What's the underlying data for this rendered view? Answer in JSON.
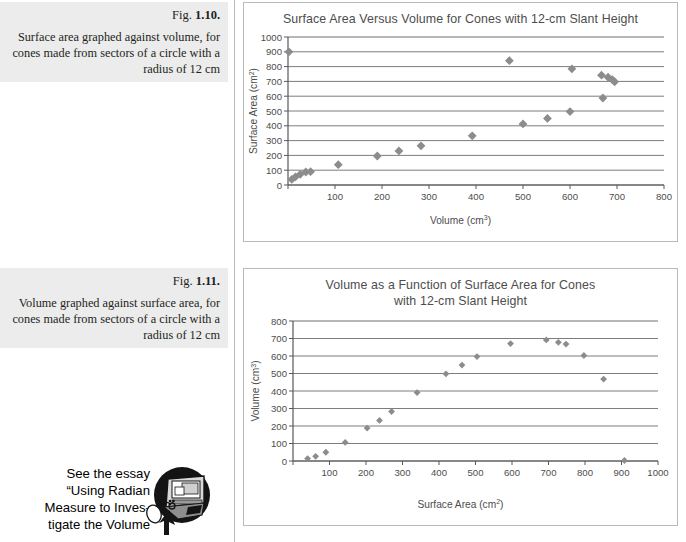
{
  "figures": [
    {
      "fig_label_prefix": "Fig. ",
      "fig_number": "1.10.",
      "caption": "Surface area graphed against volume, for cones made from sectors of a circle with a radius of 12 cm"
    },
    {
      "fig_label_prefix": "Fig. ",
      "fig_number": "1.11.",
      "caption": "Volume graphed against surface area, for cones made from sectors of a circle with a radius of 12 cm"
    }
  ],
  "essay": {
    "icon_name": "computer-mouse-icon",
    "lines": [
      "See the essay",
      "“Using Radian",
      "Measure to Inves-",
      "tigate the Volume"
    ]
  },
  "colors": {
    "marker": "#8c8c8c",
    "axis": "#58585a",
    "grid": "#6d6e71",
    "text": "#4d4d4d",
    "caption_band": "#ececec",
    "box_border": "#b9b9b9"
  },
  "chart_data": [
    {
      "type": "scatter",
      "title": "Surface Area Versus Volume for Cones with 12-cm Slant Height",
      "xlabel": "Volume (cm3)",
      "xlabel_base": "Volume (cm",
      "xlabel_sup": "3",
      "xlabel_tail": ")",
      "ylabel": "Surface Area (cm2)",
      "ylabel_base": "Surface Area (cm",
      "ylabel_sup": "2",
      "ylabel_tail": ")",
      "xlim": [
        0,
        800
      ],
      "ylim": [
        0,
        1000
      ],
      "xticks": [
        0,
        100,
        200,
        300,
        400,
        500,
        600,
        700,
        800
      ],
      "xticklabels": [
        "",
        "100",
        "200",
        "300",
        "400",
        "500",
        "600",
        "700",
        "800"
      ],
      "yticks": [
        0,
        100,
        200,
        300,
        400,
        500,
        600,
        700,
        800,
        900,
        1000
      ],
      "yticklabels": [
        "0",
        "100",
        "200",
        "300",
        "400",
        "500",
        "600",
        "700",
        "800",
        "900",
        "1000"
      ],
      "grid": "horizontal",
      "legend": "none",
      "points": [
        {
          "x": 2,
          "y": 900
        },
        {
          "x": 8,
          "y": 38
        },
        {
          "x": 16,
          "y": 55
        },
        {
          "x": 26,
          "y": 72
        },
        {
          "x": 38,
          "y": 88
        },
        {
          "x": 48,
          "y": 90
        },
        {
          "x": 107,
          "y": 137
        },
        {
          "x": 190,
          "y": 196
        },
        {
          "x": 236,
          "y": 230
        },
        {
          "x": 283,
          "y": 265
        },
        {
          "x": 392,
          "y": 332
        },
        {
          "x": 471,
          "y": 840
        },
        {
          "x": 500,
          "y": 413
        },
        {
          "x": 552,
          "y": 450
        },
        {
          "x": 600,
          "y": 496
        },
        {
          "x": 604,
          "y": 785
        },
        {
          "x": 667,
          "y": 742
        },
        {
          "x": 670,
          "y": 588
        },
        {
          "x": 681,
          "y": 728
        },
        {
          "x": 690,
          "y": 712
        },
        {
          "x": 695,
          "y": 697
        }
      ]
    },
    {
      "type": "scatter",
      "title_line1": "Volume as a Function of Surface Area for Cones",
      "title_line2": "with 12-cm Slant Height",
      "title": "Volume as a Function of Surface Area for Cones with 12-cm Slant Height",
      "xlabel": "Surface Area (cm2)",
      "xlabel_base": "Surface Area (cm",
      "xlabel_sup": "2",
      "xlabel_tail": ")",
      "ylabel": "Volume (cm3)",
      "ylabel_base": "Volume (cm",
      "ylabel_sup": "3",
      "ylabel_tail": ")",
      "xlim": [
        0,
        1000
      ],
      "ylim": [
        0,
        800
      ],
      "xticks": [
        0,
        100,
        200,
        300,
        400,
        500,
        600,
        700,
        800,
        900,
        1000
      ],
      "xticklabels": [
        "",
        "100",
        "200",
        "300",
        "400",
        "500",
        "600",
        "700",
        "800",
        "900",
        "1000"
      ],
      "yticks": [
        0,
        100,
        200,
        300,
        400,
        500,
        600,
        700,
        800
      ],
      "yticklabels": [
        "0",
        "100",
        "200",
        "300",
        "400",
        "500",
        "600",
        "700",
        "800"
      ],
      "grid": "horizontal",
      "legend": "none",
      "points": [
        {
          "x": 40,
          "y": 14
        },
        {
          "x": 62,
          "y": 27
        },
        {
          "x": 90,
          "y": 50
        },
        {
          "x": 143,
          "y": 106
        },
        {
          "x": 203,
          "y": 188
        },
        {
          "x": 237,
          "y": 232
        },
        {
          "x": 270,
          "y": 283
        },
        {
          "x": 340,
          "y": 391
        },
        {
          "x": 419,
          "y": 498
        },
        {
          "x": 463,
          "y": 548
        },
        {
          "x": 504,
          "y": 597
        },
        {
          "x": 596,
          "y": 671
        },
        {
          "x": 694,
          "y": 692
        },
        {
          "x": 727,
          "y": 678
        },
        {
          "x": 748,
          "y": 668
        },
        {
          "x": 797,
          "y": 603
        },
        {
          "x": 851,
          "y": 468
        },
        {
          "x": 908,
          "y": 3
        }
      ]
    }
  ]
}
